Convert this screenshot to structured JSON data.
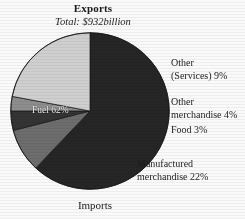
{
  "chart_data": {
    "type": "pie",
    "title": "Exports",
    "subtitle": "Total: $932billion",
    "caption": "Imports",
    "xlabel": "",
    "ylabel": "",
    "legend_position": "callout-labels",
    "grid": false,
    "total_label": "$932billion",
    "categories": [
      "Fuel",
      "Other (Services)",
      "Other merchandise",
      "Food",
      "Manufactured merchandise"
    ],
    "values": [
      62,
      9,
      4,
      3,
      22
    ],
    "unit": "percent",
    "slices": [
      {
        "name": "fuel",
        "label": "Fuel 62%",
        "value": 62,
        "color": "#2c2825",
        "label_placement": "inside"
      },
      {
        "name": "other-services",
        "label_line1": "Other",
        "label_line2": "(Services) 9%",
        "value": 9,
        "color": "#6e6e6c",
        "label_placement": "outside-right"
      },
      {
        "name": "other-merchandise",
        "label_line1": "Other",
        "label_line2": "merchandise 4%",
        "value": 4,
        "color": "#3a3633",
        "label_placement": "outside-right"
      },
      {
        "name": "food",
        "label_line1": "Food 3%",
        "label_line2": "",
        "value": 3,
        "color": "#8d8d8a",
        "label_placement": "outside-right"
      },
      {
        "name": "manufactured-merchandise",
        "label_line1": "Manufactured",
        "label_line2": "merchandise 22%",
        "value": 22,
        "color": "#cfcdc8",
        "label_placement": "outside-bottom-right"
      }
    ]
  },
  "colors": {
    "page_background": "#f7f6f4",
    "ink": "#241f1c",
    "inner_label_text": "#f2efe9",
    "slice_outline": "#1c1917"
  }
}
